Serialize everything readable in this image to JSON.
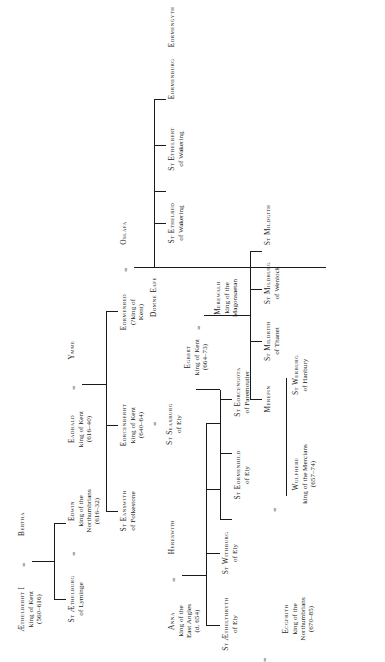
{
  "document": {
    "type": "genealogical-family-tree",
    "title": "Anglo-Saxon royal saints genealogy",
    "orientation": "rotated-90-ccw",
    "marriage_symbol": "=",
    "ink_color": "#1a1a1a",
    "paper_color": "#ffffff"
  },
  "people": [
    {
      "id": "aethelberht1",
      "name": "Æthelberht I",
      "lines": [
        "king of Kent",
        "(560–616)"
      ]
    },
    {
      "id": "bertha",
      "name": "Bertha",
      "lines": []
    },
    {
      "id": "aethelburg",
      "name": "St Æthelburg",
      "lines": [
        "of Lyminge"
      ]
    },
    {
      "id": "eadbald",
      "name": "Eadbald",
      "lines": [
        "king of Kent",
        "(616–40)"
      ]
    },
    {
      "id": "ymme",
      "name": "Ymme",
      "lines": []
    },
    {
      "id": "edwin",
      "name": "Edwin",
      "lines": [
        "king of the",
        "Northumbrians",
        "(616–32)"
      ]
    },
    {
      "id": "eorcenberht",
      "name": "Eorcenberht",
      "lines": [
        "king of Kent",
        "(640–64)"
      ]
    },
    {
      "id": "eanswith",
      "name": "St Eanswith",
      "lines": [
        "of Folkestone"
      ]
    },
    {
      "id": "eormenred",
      "name": "Eormenred",
      "lines": [
        "(?king of",
        "Kent)"
      ]
    },
    {
      "id": "anna",
      "name": "Anna",
      "lines": [
        "king of the",
        "East Angles",
        "(d. 654)"
      ]
    },
    {
      "id": "hereswith",
      "name": "Hereswith",
      "lines": []
    },
    {
      "id": "seaxburg",
      "name": "St Seaxburg",
      "lines": [
        "of Ely"
      ]
    },
    {
      "id": "egbert",
      "name": "Egbert",
      "lines": [
        "king of Kent",
        "(664–73)"
      ]
    },
    {
      "id": "domneeafe",
      "name": "Domne Eafe",
      "lines": []
    },
    {
      "id": "merewalh",
      "name": "Merewalh",
      "lines": [
        "king of the",
        "Magonsaetan"
      ]
    },
    {
      "id": "withburg",
      "name": "St Withburg",
      "lines": [
        "of Ely"
      ]
    },
    {
      "id": "eorcengota",
      "name": "St Eorcengota",
      "lines": [
        "of Faremoutier"
      ]
    },
    {
      "id": "merefin",
      "name": "Merefin",
      "lines": []
    },
    {
      "id": "mildrith",
      "name": "St Mildrith",
      "lines": [
        "of Thanet"
      ]
    },
    {
      "id": "mildburg",
      "name": "St Mildburg",
      "lines": [
        "of Wenlock"
      ]
    },
    {
      "id": "mildgith",
      "name": "St Mildgith",
      "lines": []
    },
    {
      "id": "aethelthryth",
      "name": "St Æthelthryth",
      "lines": [
        "of Ely"
      ]
    },
    {
      "id": "ecgfrith",
      "name": "Ecgfrith",
      "lines": [
        "king of the",
        "Northumbrians",
        "(670–85)"
      ]
    },
    {
      "id": "eormenhild",
      "name": "St Eormenhild",
      "lines": [
        "of Ely"
      ]
    },
    {
      "id": "wulfhere",
      "name": "Wulfhere",
      "lines": [
        "king of the Mercians",
        "(657–74)"
      ]
    },
    {
      "id": "werburg",
      "name": "St Werburg",
      "lines": [
        "of Hanbury"
      ]
    },
    {
      "id": "oslafa",
      "name": "Oslafa",
      "lines": []
    },
    {
      "id": "ethelred",
      "name": "St Ethelred",
      "lines": [
        "of Wakering"
      ]
    },
    {
      "id": "ethelbert",
      "name": "St Ethelbert",
      "lines": [
        "of Wakering"
      ]
    },
    {
      "id": "eormenburg",
      "name": "Eormenburg",
      "lines": []
    },
    {
      "id": "eormengyth",
      "name": "Eormengyth",
      "lines": []
    }
  ],
  "marriages": [
    {
      "a": "aethelberht1",
      "b": "bertha"
    },
    {
      "a": "eadbald",
      "b": "ymme"
    },
    {
      "a": "aethelburg",
      "b": "edwin"
    },
    {
      "a": "eorcenberht",
      "b": "seaxburg"
    },
    {
      "a": "eormenred",
      "b": "oslafa"
    },
    {
      "a": "domneeafe",
      "b": "merewalh"
    },
    {
      "a": "aethelthryth",
      "b": "ecgfrith"
    },
    {
      "a": "eormenhild",
      "b": "wulfhere"
    },
    {
      "a": "anna",
      "b": "hereswith"
    }
  ]
}
